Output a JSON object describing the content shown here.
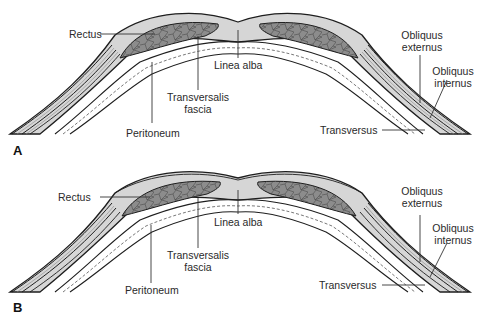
{
  "figure": {
    "panels": [
      {
        "letter": "A",
        "labels": {
          "rectus": "Rectus",
          "linea_alba": "Linea alba",
          "transversalis_fascia_1": "Transversalis",
          "transversalis_fascia_2": "fascia",
          "peritoneum": "Peritoneum",
          "obliquus_externus_1": "Obliquus",
          "obliquus_externus_2": "externus",
          "obliquus_internus_1": "Obliquus",
          "obliquus_internus_2": "internus",
          "transversus": "Transversus"
        }
      },
      {
        "letter": "B",
        "labels": {
          "rectus": "Rectus",
          "linea_alba": "Linea alba",
          "transversalis_fascia_1": "Transversalis",
          "transversalis_fascia_2": "fascia",
          "peritoneum": "Peritoneum",
          "obliquus_externus_1": "Obliquus",
          "obliquus_externus_2": "externus",
          "obliquus_internus_1": "Obliquus",
          "obliquus_internus_2": "internus",
          "transversus": "Transversus"
        }
      }
    ],
    "colors": {
      "sheath": "#c9c9c9",
      "muscle": "#8a8a8a",
      "outline": "#1e1e1e",
      "leader": "#333333"
    }
  }
}
